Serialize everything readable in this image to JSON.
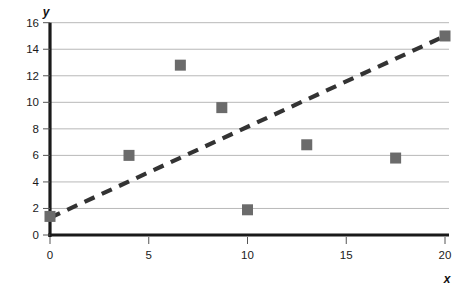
{
  "chart_data": {
    "type": "scatter",
    "title": "",
    "xlabel": "x",
    "ylabel": "y",
    "xlim": [
      0,
      20
    ],
    "ylim": [
      0,
      16
    ],
    "x_ticks": [
      0,
      5,
      10,
      15,
      20
    ],
    "y_ticks": [
      0,
      2,
      4,
      6,
      8,
      10,
      12,
      14,
      16
    ],
    "grid": "horizontal",
    "legend": "none",
    "marker": "square",
    "marker_color": "#6b6b6b",
    "axis_color": "#1a1a1a",
    "grid_color": "#b8b8b8",
    "trendline_color": "#333333",
    "points": [
      {
        "x": 0.0,
        "y": 1.4
      },
      {
        "x": 4.0,
        "y": 6.0
      },
      {
        "x": 6.6,
        "y": 12.8
      },
      {
        "x": 8.7,
        "y": 9.6
      },
      {
        "x": 10.0,
        "y": 1.9
      },
      {
        "x": 13.0,
        "y": 6.8
      },
      {
        "x": 17.5,
        "y": 5.8
      },
      {
        "x": 20.0,
        "y": 15.0
      }
    ],
    "trendline": {
      "style": "dashed",
      "x0": 0.0,
      "y0": 1.3,
      "x1": 20.0,
      "y1": 15.0
    }
  },
  "labels": {
    "y_axis_title": "y",
    "x_axis_title": "x",
    "y_ticks": [
      "0",
      "2",
      "4",
      "6",
      "8",
      "10",
      "12",
      "14",
      "16"
    ],
    "x_ticks": [
      "0",
      "5",
      "10",
      "15",
      "20"
    ]
  }
}
